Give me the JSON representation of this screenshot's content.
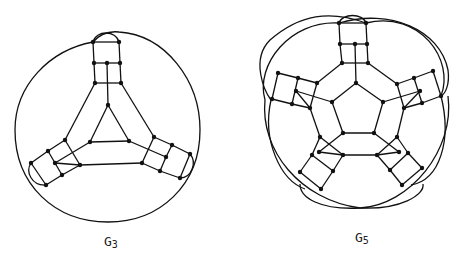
{
  "figures": [
    {
      "id": "G3",
      "label_main": "G",
      "label_sub": "3",
      "description": "Cubic graph with triangular core, three 3-armed ladder gadgets, enclosed by outer circle"
    },
    {
      "id": "G5",
      "label_main": "G",
      "label_sub": "5",
      "description": "Cubic graph with pentagonal core, five ladder gadgets, enclosed by overlapping outer arcs"
    }
  ]
}
